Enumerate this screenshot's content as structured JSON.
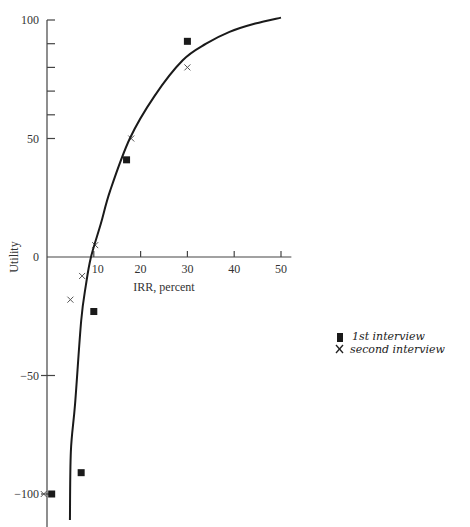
{
  "chart_data": {
    "type": "scatter",
    "title": "",
    "xlabel": "IRR, percent",
    "ylabel": "Utility",
    "xlim": [
      0,
      52
    ],
    "ylim": [
      -112,
      102
    ],
    "grid": false,
    "x_ticks": [
      {
        "value": 10,
        "label": "10"
      },
      {
        "value": 20,
        "label": "20"
      },
      {
        "value": 30,
        "label": "30"
      },
      {
        "value": 40,
        "label": "40"
      },
      {
        "value": 50,
        "label": "50"
      }
    ],
    "y_ticks": [
      {
        "value": 100,
        "label": "100"
      },
      {
        "value": 90,
        "label": ""
      },
      {
        "value": 80,
        "label": ""
      },
      {
        "value": 70,
        "label": ""
      },
      {
        "value": 60,
        "label": ""
      },
      {
        "value": 50,
        "label": "50"
      },
      {
        "value": 0,
        "label": "0"
      },
      {
        "value": -50,
        "label": "−50"
      },
      {
        "value": -100,
        "label": "−100"
      }
    ],
    "legend": {
      "placement": "right",
      "style": "handwritten",
      "entries": [
        {
          "marker": "square",
          "label": "1st interview"
        },
        {
          "marker": "x",
          "label": "second interview"
        }
      ]
    },
    "series": [
      {
        "name": "1st interview",
        "marker": "square",
        "points": [
          {
            "x": 30,
            "y": 91
          },
          {
            "x": 17,
            "y": 41
          },
          {
            "x": 10,
            "y": -23
          },
          {
            "x": 7.3,
            "y": -91
          },
          {
            "x": 1,
            "y": -100
          }
        ]
      },
      {
        "name": "second interview",
        "marker": "x",
        "points": [
          {
            "x": 30,
            "y": 80
          },
          {
            "x": 18,
            "y": 50
          },
          {
            "x": 10.3,
            "y": 5
          },
          {
            "x": 7.5,
            "y": -8
          },
          {
            "x": 5,
            "y": -18
          },
          {
            "x": -0.7,
            "y": -100
          }
        ]
      },
      {
        "name": "fitted utility curve",
        "marker": "none",
        "line": true,
        "points": [
          {
            "x": 4.9,
            "y": -111
          },
          {
            "x": 5.1,
            "y": -82
          },
          {
            "x": 6.0,
            "y": -62
          },
          {
            "x": 7.3,
            "y": -27
          },
          {
            "x": 8.3,
            "y": -12
          },
          {
            "x": 9.4,
            "y": 0
          },
          {
            "x": 11.5,
            "y": 14
          },
          {
            "x": 13.5,
            "y": 28
          },
          {
            "x": 17.7,
            "y": 50
          },
          {
            "x": 23,
            "y": 68
          },
          {
            "x": 29,
            "y": 83
          },
          {
            "x": 34,
            "y": 90
          },
          {
            "x": 39,
            "y": 95
          },
          {
            "x": 44.5,
            "y": 98.5
          },
          {
            "x": 50,
            "y": 101
          }
        ]
      }
    ]
  }
}
